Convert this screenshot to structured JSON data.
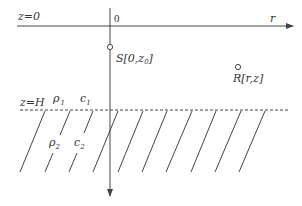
{
  "diagram": {
    "type": "layered-waveguide-geometry",
    "colors": {
      "line": "#444444",
      "text": "#333333",
      "background": "#ffffff"
    },
    "axes": {
      "horizontal": {
        "label": "r",
        "surface_label": "z=0"
      },
      "vertical": {
        "origin_label": "0"
      }
    },
    "source": {
      "label": "S[0,z",
      "sub": "0",
      "close": "]"
    },
    "receiver": {
      "label": "R[r,z]"
    },
    "interface": {
      "label": "z=H"
    },
    "layer1": {
      "rho": "ρ",
      "rho_sub": "1",
      "c": "c",
      "c_sub": "1"
    },
    "layer2": {
      "rho": "ρ",
      "rho_sub": "2",
      "c": "c",
      "c_sub": "2"
    }
  }
}
